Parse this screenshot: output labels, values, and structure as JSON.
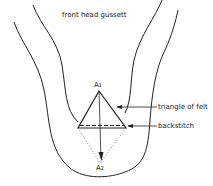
{
  "figure": {
    "top_label": "front head gussett",
    "point_a1": {
      "letter": "A",
      "sub": "1"
    },
    "point_a2": {
      "letter": "A",
      "sub": "2"
    },
    "callouts": [
      {
        "label": "triangle of felt"
      },
      {
        "label": "backstitch"
      }
    ],
    "caption_fragment": "FIGURE 7"
  }
}
